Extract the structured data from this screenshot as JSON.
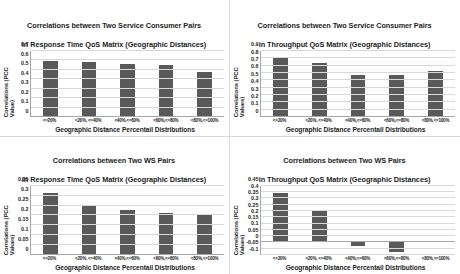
{
  "figure": {
    "panels": [
      "top-left",
      "top-right",
      "bottom-left",
      "bottom-right"
    ],
    "bar_color": "#595959",
    "grid_color": "#d9d9d9",
    "background": "#ffffff"
  },
  "chart_data": [
    {
      "type": "bar",
      "panel": "top-left",
      "title": "Correlations between Two Service Consumer Pairs\nin Response Time QoS Matrix (Geographic Distances)",
      "title_line1": "Correlations between Two Service Consumer Pairs",
      "title_line2": "in Response Time QoS Matrix (Geographic Distances)",
      "xlabel": "Geographic Distance Percentail Distributions",
      "ylabel": "Correlations (PCC Value)",
      "categories": [
        "<=20%",
        "<20%, <=40%",
        "<40%,<=60%",
        "<60%,<=80%",
        "<80%,<=100%"
      ],
      "values": [
        0.59,
        0.58,
        0.565,
        0.545,
        0.48
      ],
      "ylim": [
        0,
        0.7
      ],
      "yticks": [
        "0",
        "0.1",
        "0.2",
        "0.3",
        "0.4",
        "0.5",
        "0.6",
        "0.7"
      ],
      "ytick_values": [
        0,
        0.1,
        0.2,
        0.3,
        0.4,
        0.5,
        0.6,
        0.7
      ],
      "grid": true,
      "legend": "none"
    },
    {
      "type": "bar",
      "panel": "top-right",
      "title": "Correlations between Two Service Consumer Pairs\nin Throughput QoS Matrix (Geographic Distances)",
      "title_line1": "Correlations between Two Service Consumer Pairs",
      "title_line2": "in Throughput QoS Matrix (Geographic Distances)",
      "xlabel": "Geographic Distance Percentail Distributions",
      "ylabel": "Correlations (PCC Values)",
      "categories": [
        "<=20%",
        "<20%, <=40%",
        "<40%,<=60%",
        "<60%,<=80%",
        "<80%,<=100%"
      ],
      "values": [
        0.82,
        0.73,
        0.57,
        0.575,
        0.62
      ],
      "ylim": [
        0,
        0.9
      ],
      "yticks": [
        "0",
        "0.1",
        "0.2",
        "0.3",
        "0.4",
        "0.5",
        "0.6",
        "0.7",
        "0.8",
        "0.9"
      ],
      "ytick_values": [
        0,
        0.1,
        0.2,
        0.3,
        0.4,
        0.5,
        0.6,
        0.7,
        0.8,
        0.9
      ],
      "grid": true,
      "legend": "none"
    },
    {
      "type": "bar",
      "panel": "bottom-left",
      "title": "Correlations between Two WS Pairs\nin Response Time QoS Matrix (Geographic Distances)",
      "title_line1": "Correlations between Two WS Pairs",
      "title_line2": "in Response Time QoS Matrix (Geographic Distances)",
      "xlabel": "Geographic Distance Percentail Distributions",
      "ylabel": "Correlations (PCC Values)",
      "categories": [
        "<=20%",
        "<20%, <=40%",
        "<40%,<=60%",
        "<60%,<=80%",
        "<80%,<=100%"
      ],
      "values": [
        0.312,
        0.248,
        0.227,
        0.213,
        0.208
      ],
      "ylim": [
        0,
        0.35
      ],
      "yticks": [
        "0",
        "0.05",
        "0.1",
        "0.15",
        "0.2",
        "0.25",
        "0.3",
        "0.35"
      ],
      "ytick_values": [
        0,
        0.05,
        0.1,
        0.15,
        0.2,
        0.25,
        0.3,
        0.35
      ],
      "grid": true,
      "legend": "none"
    },
    {
      "type": "bar",
      "panel": "bottom-right",
      "title": "Correlations between Two WS Pairs\nin Throughput QoS Matrix (Geographic Distances)",
      "title_line1": "Correlations between Two WS Pairs",
      "title_line2": "in Throughput QoS Matrix (Geographic Distances)",
      "xlabel": "Geographic Distance Percentail Distributions",
      "ylabel": "Correlations (PCC Values)",
      "categories": [
        "<=20%",
        "<20%, <=40%",
        "<40%,<=60%",
        "<60%,<=80%",
        "<80%,<=100%"
      ],
      "values": [
        0.39,
        0.25,
        -0.028,
        -0.075,
        0.012
      ],
      "ylim": [
        -0.1,
        0.45
      ],
      "yticks": [
        "-0.1",
        "-0.05",
        "0",
        "0.05",
        "0.1",
        "0.15",
        "0.2",
        "0.25",
        "0.3",
        "0.35",
        "0.4",
        "0.45"
      ],
      "ytick_values": [
        -0.1,
        -0.05,
        0,
        0.05,
        0.1,
        0.15,
        0.2,
        0.25,
        0.3,
        0.35,
        0.4,
        0.45
      ],
      "grid": true,
      "legend": "none"
    }
  ]
}
